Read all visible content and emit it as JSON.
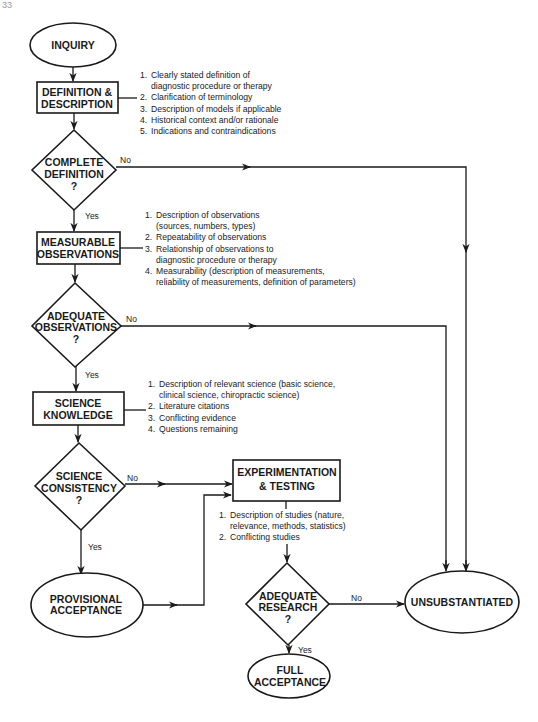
{
  "page": {
    "number_fragment": "33"
  },
  "nodes": {
    "inquiry": {
      "label": "INQUIRY"
    },
    "definition": {
      "line1": "DEFINITION &",
      "line2": "DESCRIPTION"
    },
    "complete_definition": {
      "line1": "COMPLETE",
      "line2": "DEFINITION",
      "line3": "?"
    },
    "measurable": {
      "line1": "MEASURABLE",
      "line2": "OBSERVATIONS"
    },
    "adequate_observations": {
      "line1": "ADEQUATE",
      "line2": "OBSERVATIONS",
      "line3": "?"
    },
    "science_knowledge": {
      "line1": "SCIENCE",
      "line2": "KNOWLEDGE"
    },
    "science_consistency": {
      "line1": "SCIENCE",
      "line2": "CONSISTENCY",
      "line3": "?"
    },
    "experimentation": {
      "line1": "EXPERIMENTATION",
      "line2": "& TESTING"
    },
    "provisional": {
      "line1": "PROVISIONAL",
      "line2": "ACCEPTANCE"
    },
    "adequate_research": {
      "line1": "ADEQUATE",
      "line2": "RESEARCH",
      "line3": "?"
    },
    "unsubstantiated": {
      "label": "UNSUBSTANTIATED"
    },
    "full_acceptance": {
      "line1": "FULL",
      "line2": "ACCEPTANCE"
    }
  },
  "edge_labels": {
    "yes": "Yes",
    "no": "No"
  },
  "notes": {
    "definition": [
      {
        "num": "1.",
        "text": "Clearly stated definition of",
        "cont": "diagnostic procedure or therapy"
      },
      {
        "num": "2.",
        "text": "Clarification of terminology"
      },
      {
        "num": "3.",
        "text": "Description of models if applicable"
      },
      {
        "num": "4.",
        "text": "Historical context and/or rationale"
      },
      {
        "num": "5.",
        "text": "Indications and contraindications"
      }
    ],
    "measurable": [
      {
        "num": "1.",
        "text": "Description of observations",
        "cont": "(sources, numbers, types)"
      },
      {
        "num": "2.",
        "text": "Repeatability of observations"
      },
      {
        "num": "3.",
        "text": "Relationship of observations to",
        "cont": "diagnostic procedure or therapy"
      },
      {
        "num": "4.",
        "text": "Measurability (description of measurements,",
        "cont": "reliability of measurements, definition of parameters)"
      }
    ],
    "science": [
      {
        "num": "1.",
        "text": "Description of relevant science (basic science,",
        "cont": "clinical science, chiropractic science)"
      },
      {
        "num": "2.",
        "text": "Literature citations"
      },
      {
        "num": "3.",
        "text": "Conflicting evidence"
      },
      {
        "num": "4.",
        "text": "Questions remaining"
      }
    ],
    "experimentation": [
      {
        "num": "1.",
        "text": "Description of studies (nature,",
        "cont": "relevance, methods, statistics)"
      },
      {
        "num": "2.",
        "text": "Conflicting studies"
      }
    ]
  },
  "colors": {
    "ink": "#1a1a1a",
    "background": "#ffffff"
  }
}
